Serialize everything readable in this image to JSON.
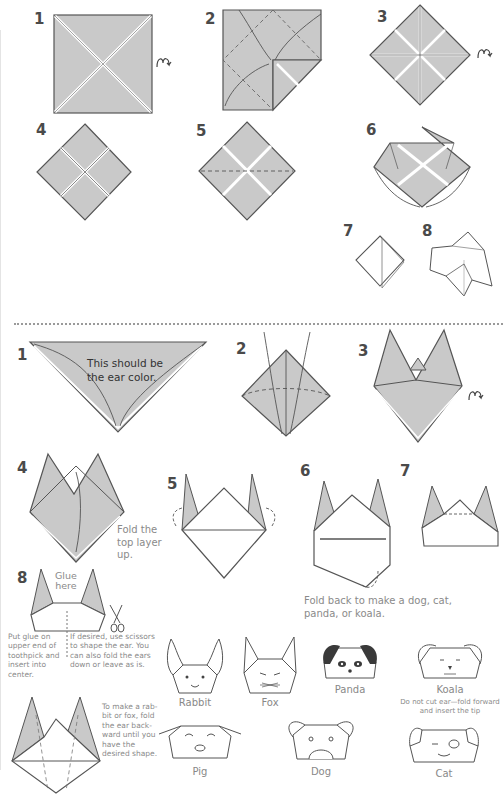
{
  "colors": {
    "paper_fill": "#c9c9c9",
    "line": "#555555",
    "caption": "#8a8a8a",
    "number": "#4a4a4a",
    "panda_dark": "#3a3a3a"
  },
  "part1": {
    "steps": [
      {
        "num": "1",
        "icon": "turn-over-icon"
      },
      {
        "num": "2"
      },
      {
        "num": "3",
        "icon": "turn-over-icon"
      },
      {
        "num": "4"
      },
      {
        "num": "5"
      },
      {
        "num": "6"
      },
      {
        "num": "7"
      },
      {
        "num": "8"
      }
    ]
  },
  "part2": {
    "steps": [
      {
        "num": "1",
        "text_line1": "This should be",
        "text_line2": "the ear color."
      },
      {
        "num": "2"
      },
      {
        "num": "3",
        "icon": "turn-over-icon"
      },
      {
        "num": "4",
        "caption_line1": "Fold the",
        "caption_line2": "top layer",
        "caption_line3": "up."
      },
      {
        "num": "5"
      },
      {
        "num": "6",
        "caption_line1": "Fold back to make a dog, cat,",
        "caption_line2": "panda, or koala."
      },
      {
        "num": "7"
      },
      {
        "num": "8",
        "glue_line1": "Glue",
        "glue_line2": "here",
        "left_caption": [
          "Put glue on",
          "upper end of",
          "toothpick and",
          "insert into",
          "center."
        ],
        "right_caption": [
          "If desired, use scissors",
          "to shape the ear. You",
          "can also fold the ears",
          "down or leave as is."
        ]
      }
    ],
    "rabbit_fox_caption": [
      "To make a rab-",
      "bit or fox, fold",
      "the ear back-",
      "ward until you",
      "have the",
      "desired shape."
    ]
  },
  "animals": [
    {
      "name": "Rabbit"
    },
    {
      "name": "Fox"
    },
    {
      "name": "Panda"
    },
    {
      "name": "Koala",
      "note_line1": "Do not cut ear—fold forward",
      "note_line2": "and insert the tip"
    },
    {
      "name": "Pig"
    },
    {
      "name": "Dog"
    },
    {
      "name": "Cat"
    }
  ]
}
